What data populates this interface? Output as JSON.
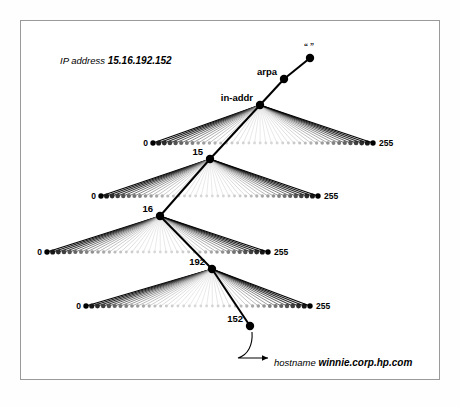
{
  "figure": {
    "title_caption": {
      "prefix": "IP address ",
      "value": "15.16.192.152"
    },
    "hostname_annotation": {
      "prefix": "hostname ",
      "value": "winnie.corp.hp.com"
    },
    "root_label": "“ ”",
    "range_start_label": "0",
    "range_end_label": "255",
    "path_nodes": [
      {
        "label": "“ ”",
        "x": 310,
        "y": 58
      },
      {
        "label": "arpa",
        "x": 284,
        "y": 79
      },
      {
        "label": "in-addr",
        "x": 260,
        "y": 105
      },
      {
        "label": "15",
        "x": 210,
        "y": 159
      },
      {
        "label": "16",
        "x": 160,
        "y": 216
      },
      {
        "label": "192",
        "x": 212,
        "y": 269
      },
      {
        "label": "152",
        "x": 250,
        "y": 326
      }
    ],
    "fans": [
      {
        "parent": "in-addr",
        "parent_x": 260,
        "parent_y": 105,
        "row_y": 143,
        "left_x": 153,
        "right_x": 373,
        "selected_label": "15",
        "selected_index": 15,
        "count": 40
      },
      {
        "parent": "15",
        "parent_x": 210,
        "parent_y": 159,
        "row_y": 196,
        "left_x": 101,
        "right_x": 318,
        "selected_label": "16",
        "selected_index": 16,
        "count": 40
      },
      {
        "parent": "16",
        "parent_x": 160,
        "parent_y": 216,
        "row_y": 252,
        "left_x": 47,
        "right_x": 268,
        "selected_label": "192",
        "selected_index": 192,
        "count": 40
      },
      {
        "parent": "192",
        "parent_x": 212,
        "parent_y": 269,
        "row_y": 306,
        "left_x": 86,
        "right_x": 310,
        "selected_label": "152",
        "selected_index": 152,
        "count": 40
      }
    ],
    "colors": {
      "ink": "#000000",
      "faded": "#d8d8d8",
      "frame": "#9a9a9a",
      "background": "#ffffff"
    }
  }
}
